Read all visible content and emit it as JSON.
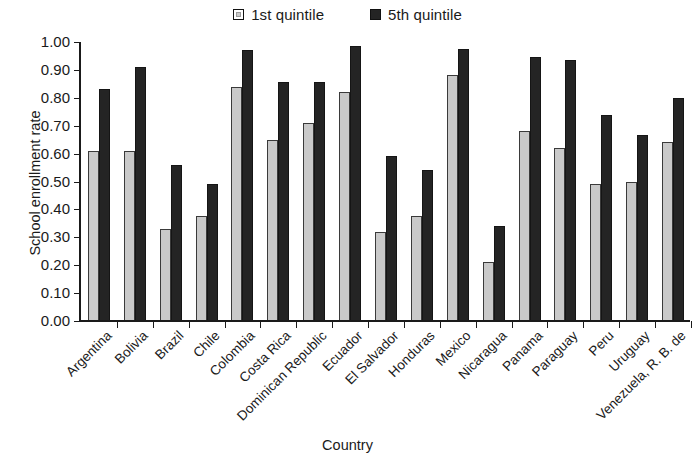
{
  "chart_data": {
    "type": "bar",
    "title": "",
    "xlabel": "Country",
    "ylabel": "School enrollment rate",
    "ylim": [
      0,
      1.0
    ],
    "ytick_labels": [
      "0.00",
      "0.10",
      "0.20",
      "0.30",
      "0.40",
      "0.50",
      "0.60",
      "0.70",
      "0.80",
      "0.90",
      "1.00"
    ],
    "ytick_values": [
      0.0,
      0.1,
      0.2,
      0.3,
      0.4,
      0.5,
      0.6,
      0.7,
      0.8,
      0.9,
      1.0
    ],
    "grid": false,
    "legend_position": "top-center",
    "categories": [
      "Argentina",
      "Bolivia",
      "Brazil",
      "Chile",
      "Colombia",
      "Costa Rica",
      "Dominican Republic",
      "Ecuador",
      "El Salvador",
      "Honduras",
      "Mexico",
      "Nicaragua",
      "Panama",
      "Paraguay",
      "Peru",
      "Uruguay",
      "Venezuela, R. B. de"
    ],
    "series": [
      {
        "name": "1st quintile",
        "color": "#c9c9c9",
        "values": [
          0.61,
          0.61,
          0.33,
          0.375,
          0.84,
          0.65,
          0.71,
          0.82,
          0.32,
          0.375,
          0.88,
          0.21,
          0.68,
          0.62,
          0.49,
          0.5,
          0.64
        ]
      },
      {
        "name": "5th quintile",
        "color": "#242424",
        "values": [
          0.83,
          0.91,
          0.56,
          0.49,
          0.97,
          0.855,
          0.855,
          0.985,
          0.59,
          0.54,
          0.975,
          0.34,
          0.945,
          0.935,
          0.74,
          0.665,
          0.8
        ]
      }
    ]
  }
}
